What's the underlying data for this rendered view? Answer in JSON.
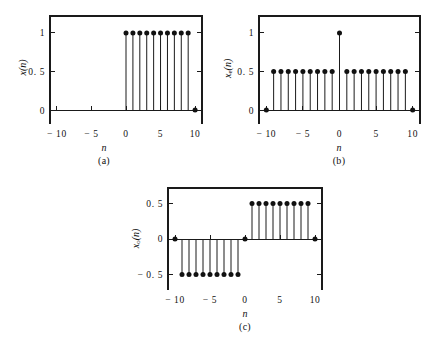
{
  "figure": {
    "background_color": "#ffffff",
    "ink_color": "#111111"
  },
  "chart_data": [
    {
      "type": "scatter",
      "panel_id": "a",
      "caption": "(a)",
      "title": "",
      "xlabel": "n",
      "ylabel": "x(n)",
      "ylabel_base": "x",
      "ylabel_sub": "",
      "xlim": [
        -11,
        11
      ],
      "ylim": [
        -0.18,
        1.22
      ],
      "xticks": [
        -10,
        -5,
        0,
        5,
        10
      ],
      "xtick_labels": [
        "− 10",
        "− 5",
        "0",
        "5",
        "10"
      ],
      "yticks": [
        0,
        0.5,
        1
      ],
      "ytick_labels": [
        "0",
        "0. 5",
        "1"
      ],
      "grid": false,
      "legend": "none",
      "x": [
        -10,
        -9,
        -8,
        -7,
        -6,
        -5,
        -4,
        -3,
        -2,
        -1,
        0,
        1,
        2,
        3,
        4,
        5,
        6,
        7,
        8,
        9,
        10
      ],
      "values": [
        0,
        0,
        0,
        0,
        0,
        0,
        0,
        0,
        0,
        0,
        1,
        1,
        1,
        1,
        1,
        1,
        1,
        1,
        1,
        1,
        0
      ],
      "markers_drawn_at": [
        0,
        1,
        2,
        3,
        4,
        5,
        6,
        7,
        8,
        9,
        10
      ],
      "baseline": 0
    },
    {
      "type": "scatter",
      "panel_id": "b",
      "caption": "(b)",
      "title": "",
      "xlabel": "n",
      "ylabel": "xe(n)",
      "ylabel_base": "x",
      "ylabel_sub": "e",
      "xlim": [
        -11,
        11
      ],
      "ylim": [
        -0.18,
        1.22
      ],
      "xticks": [
        -10,
        -5,
        0,
        5,
        10
      ],
      "xtick_labels": [
        "− 10",
        "− 5",
        "0",
        "5",
        "10"
      ],
      "yticks": [
        0,
        0.5,
        1
      ],
      "ytick_labels": [
        "0",
        "0. 5",
        "1"
      ],
      "grid": false,
      "legend": "none",
      "x": [
        -10,
        -9,
        -8,
        -7,
        -6,
        -5,
        -4,
        -3,
        -2,
        -1,
        0,
        1,
        2,
        3,
        4,
        5,
        6,
        7,
        8,
        9,
        10
      ],
      "values": [
        0,
        0.5,
        0.5,
        0.5,
        0.5,
        0.5,
        0.5,
        0.5,
        0.5,
        0.5,
        1,
        0.5,
        0.5,
        0.5,
        0.5,
        0.5,
        0.5,
        0.5,
        0.5,
        0.5,
        0
      ],
      "markers_drawn_at": [
        -10,
        -9,
        -8,
        -7,
        -6,
        -5,
        -4,
        -3,
        -2,
        -1,
        0,
        1,
        2,
        3,
        4,
        5,
        6,
        7,
        8,
        9,
        10
      ],
      "baseline": 0
    },
    {
      "type": "scatter",
      "panel_id": "c",
      "caption": "(c)",
      "title": "",
      "xlabel": "n",
      "ylabel": "xo(n)",
      "ylabel_base": "x",
      "ylabel_sub": "o",
      "xlim": [
        -11,
        11
      ],
      "ylim": [
        -0.72,
        0.72
      ],
      "xticks": [
        -10,
        -5,
        0,
        5,
        10
      ],
      "xtick_labels": [
        "− 10",
        "− 5",
        "0",
        "5",
        "10"
      ],
      "yticks": [
        -0.5,
        0,
        0.5
      ],
      "ytick_labels": [
        "− 0. 5",
        "0",
        "0. 5"
      ],
      "grid": false,
      "legend": "none",
      "x": [
        -10,
        -9,
        -8,
        -7,
        -6,
        -5,
        -4,
        -3,
        -2,
        -1,
        0,
        1,
        2,
        3,
        4,
        5,
        6,
        7,
        8,
        9,
        10
      ],
      "values": [
        0,
        -0.5,
        -0.5,
        -0.5,
        -0.5,
        -0.5,
        -0.5,
        -0.5,
        -0.5,
        -0.5,
        0,
        0.5,
        0.5,
        0.5,
        0.5,
        0.5,
        0.5,
        0.5,
        0.5,
        0.5,
        0
      ],
      "markers_drawn_at": [
        -10,
        -9,
        -8,
        -7,
        -6,
        -5,
        -4,
        -3,
        -2,
        -1,
        0,
        1,
        2,
        3,
        4,
        5,
        6,
        7,
        8,
        9,
        10
      ],
      "baseline": 0
    }
  ]
}
